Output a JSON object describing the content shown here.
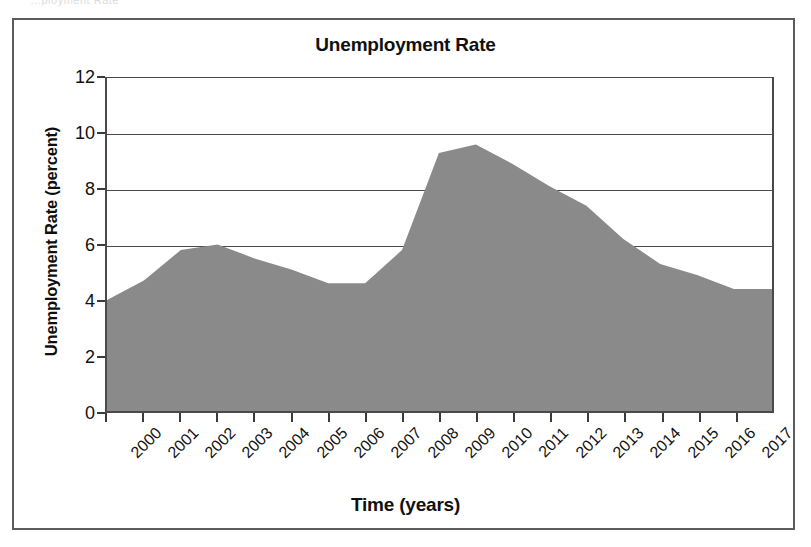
{
  "figure": {
    "scan_ghost_text": "…ployment Rate"
  },
  "chart_data": {
    "type": "area",
    "title": "Unemployment Rate",
    "xlabel": "Time (years)",
    "ylabel": "Unemployment Rate (percent)",
    "categories": [
      "2000",
      "2001",
      "2002",
      "2003",
      "2004",
      "2005",
      "2006",
      "2007",
      "2008",
      "2009",
      "2010",
      "2011",
      "2012",
      "2013",
      "2014",
      "2015",
      "2016",
      "2017"
    ],
    "values": [
      4.0,
      4.7,
      5.8,
      6.0,
      5.5,
      5.1,
      4.6,
      4.6,
      5.8,
      9.3,
      9.6,
      8.9,
      8.1,
      7.4,
      6.2,
      5.3,
      4.9,
      4.4
    ],
    "ylim": [
      0,
      12
    ],
    "y_ticks": [
      "0",
      "2",
      "4",
      "6",
      "8",
      "10",
      "12"
    ],
    "y_tick_values": [
      0,
      2,
      4,
      6,
      8,
      10,
      12
    ],
    "grid": "horizontal",
    "legend": "none",
    "series_name": "Unemployment Rate",
    "colors": {
      "area_fill": "#8a8a8a",
      "axis": "#4a4a4a",
      "grid": "#4a4a4a",
      "text": "#111111",
      "frame": "#5c5c5c",
      "background": "#ffffff"
    }
  }
}
